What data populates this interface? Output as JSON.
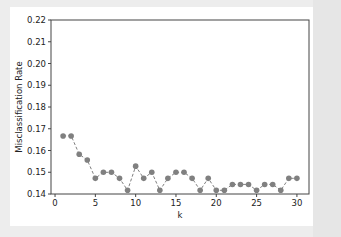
{
  "chart_data": {
    "type": "line",
    "title": "",
    "xlabel": "k",
    "ylabel": "Misclassification Rate",
    "xlim": [
      -0.5,
      31.5
    ],
    "ylim": [
      0.14,
      0.22
    ],
    "grid": false,
    "legend": null,
    "x_ticks": [
      0,
      5,
      10,
      15,
      20,
      25,
      30
    ],
    "x_tick_labels": [
      "0",
      "5",
      "10",
      "15",
      "20",
      "25",
      "30"
    ],
    "y_ticks": [
      0.14,
      0.15,
      0.16,
      0.17,
      0.18,
      0.19,
      0.2,
      0.21,
      0.22
    ],
    "y_tick_labels": [
      "0.14",
      "0.15",
      "0.16",
      "0.17",
      "0.18",
      "0.19",
      "0.20",
      "0.21",
      "0.22"
    ],
    "series": [
      {
        "name": "Misclassification Rate",
        "style": "dashed line with circle markers",
        "color": "#808080",
        "x": [
          1,
          2,
          3,
          4,
          5,
          6,
          7,
          8,
          9,
          10,
          11,
          12,
          13,
          14,
          15,
          16,
          17,
          18,
          19,
          20,
          21,
          22,
          23,
          24,
          25,
          26,
          27,
          28,
          29,
          30
        ],
        "values": [
          0.1667,
          0.1667,
          0.1583,
          0.1556,
          0.1472,
          0.15,
          0.15,
          0.1472,
          0.1417,
          0.1528,
          0.1472,
          0.15,
          0.1417,
          0.1472,
          0.15,
          0.15,
          0.1472,
          0.1417,
          0.1472,
          0.1417,
          0.1417,
          0.1444,
          0.1444,
          0.1444,
          0.1417,
          0.1444,
          0.1444,
          0.1417,
          0.1472,
          0.1472
        ]
      }
    ]
  }
}
